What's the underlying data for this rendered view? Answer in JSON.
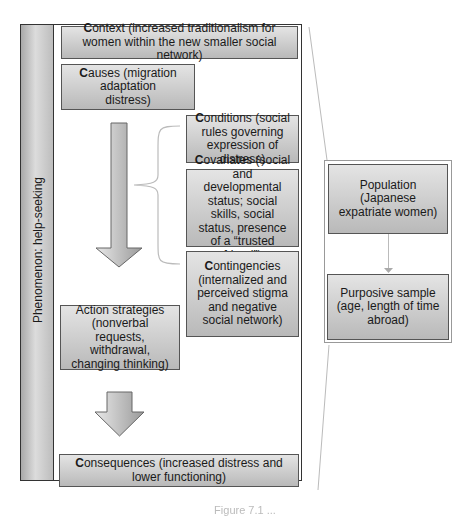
{
  "sidebar": {
    "label": "Phenomenon: help-seeking"
  },
  "boxes": {
    "context": {
      "initial": "C",
      "rest": "ontext (increased traditionalism for women within the new smaller social network)"
    },
    "causes": {
      "initial": "C",
      "rest": "auses (migration adaptation distress)"
    },
    "conditions": {
      "initial": "C",
      "rest": "onditions (social rules governing expression of distress)"
    },
    "covariates": {
      "initial": "C",
      "rest": "ovariates (social and developmental status; social skills, social status, presence of a “trusted friend”)"
    },
    "contingencies": {
      "initial": "C",
      "rest": "ontingencies (internalized and perceived stigma and negative social network)"
    },
    "action_strategies": {
      "text": "Action strategies (nonverbal requests, withdrawal, changing thinking)"
    },
    "consequences": {
      "initial": "C",
      "rest": "onsequences (increased distress and lower functioning)"
    }
  },
  "sample_panel": {
    "population": "Population (Japanese expatriate women)",
    "purposive_sample": "Purposive sample (age, length of time abroad)"
  },
  "caption": "Figure 7.1 ..."
}
